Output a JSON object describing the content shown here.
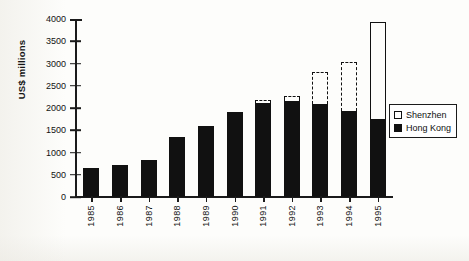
{
  "chart_data": {
    "type": "bar",
    "title": "",
    "subtitle": "",
    "xlabel": "",
    "ylabel": "US$ millions",
    "ylim": [
      0,
      4000
    ],
    "ytick_step": 500,
    "yticks": [
      0,
      500,
      1000,
      1500,
      2000,
      2500,
      3000,
      3500,
      4000
    ],
    "ytick_labels": [
      "0",
      "500",
      "1000",
      "1500",
      "2000",
      "2500",
      "3000",
      "3500",
      "4000"
    ],
    "categories": [
      "1985",
      "1986",
      "1987",
      "1988",
      "1989",
      "1990",
      "1991",
      "1992",
      "1993",
      "1994",
      "1995"
    ],
    "stacked": true,
    "grid": false,
    "legend_position": "right-middle",
    "series": [
      {
        "name": "Hong Kong",
        "style": "filled-black",
        "color": "#111111",
        "values": [
          650,
          720,
          840,
          1350,
          1590,
          1910,
          2110,
          2150,
          2080,
          1940,
          1750
        ]
      },
      {
        "name": "Shenzhen",
        "style": "open-outline",
        "color": "#ffffff",
        "outline": "#111111",
        "values": [
          0,
          0,
          0,
          0,
          0,
          0,
          80,
          130,
          740,
          1090,
          2180
        ]
      }
    ],
    "series_outline_style": {
      "1985": "none",
      "1986": "none",
      "1987": "none",
      "1988": "none",
      "1989": "none",
      "1990": "none",
      "1991": "dashed",
      "1992": "dashed",
      "1993": "dashed",
      "1994": "dashed",
      "1995": "solid"
    },
    "totals": [
      650,
      720,
      840,
      1350,
      1590,
      1910,
      2190,
      2280,
      2820,
      3030,
      3930
    ]
  },
  "legend": {
    "items": [
      {
        "label": "Shenzhen",
        "swatch": "open"
      },
      {
        "label": "Hong Kong",
        "swatch": "filled"
      }
    ]
  }
}
